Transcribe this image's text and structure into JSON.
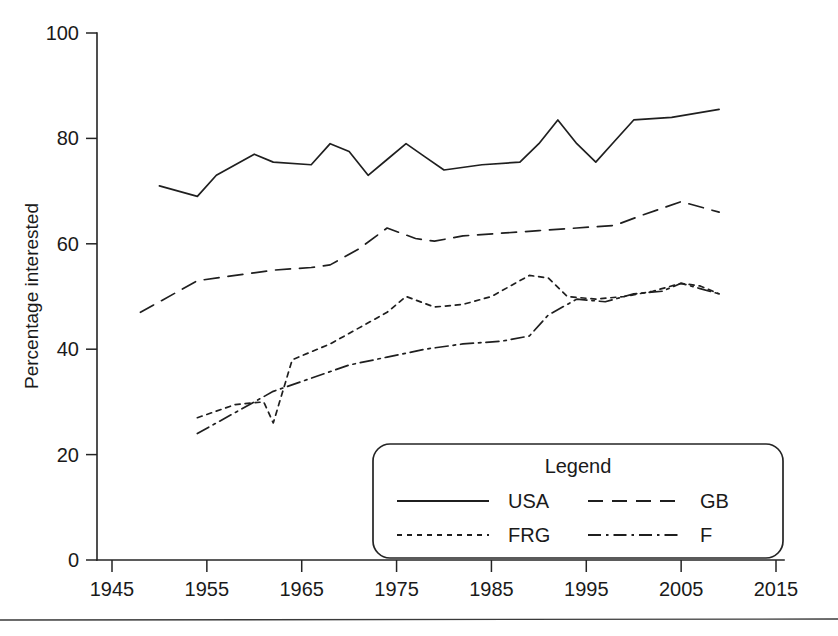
{
  "chart_data": {
    "type": "line",
    "title": "",
    "xlabel": "",
    "ylabel": "Percentage interested",
    "xlim": [
      1945,
      2015
    ],
    "ylim": [
      0,
      100
    ],
    "grid": false,
    "legend_position": "bottom-right",
    "legend_title": "Legend",
    "xticks": [
      "1945",
      "1955",
      "1965",
      "1975",
      "1985",
      "1995",
      "2005",
      "2015"
    ],
    "xtick_values": [
      1945,
      1955,
      1965,
      1975,
      1985,
      1995,
      2005,
      2015
    ],
    "yticks": [
      "0",
      "20",
      "40",
      "60",
      "80",
      "100"
    ],
    "ytick_values": [
      0,
      20,
      40,
      60,
      80,
      100
    ],
    "series": [
      {
        "name": "USA",
        "style": "solid",
        "x": [
          1950,
          1954,
          1956,
          1960,
          1962,
          1966,
          1968,
          1970,
          1972,
          1974,
          1976,
          1978,
          1980,
          1984,
          1988,
          1990,
          1992,
          1994,
          1996,
          1998,
          2000,
          2004,
          2009
        ],
        "values": [
          71,
          69,
          73,
          77,
          75.5,
          75,
          79,
          77.5,
          73,
          76,
          79,
          76.5,
          74,
          75,
          75.5,
          79,
          83.5,
          79,
          75.5,
          79.5,
          83.5,
          84,
          85.5
        ]
      },
      {
        "name": "GB",
        "style": "dashed",
        "x": [
          1948,
          1954,
          1958,
          1962,
          1966,
          1968,
          1971,
          1974,
          1977,
          1979,
          1982,
          1986,
          1990,
          1994,
          1998,
          2001,
          2005,
          2009
        ],
        "values": [
          47,
          53,
          54,
          55,
          55.5,
          56,
          59,
          63,
          61,
          60.5,
          61.5,
          62,
          62.5,
          63,
          63.5,
          65.5,
          68,
          66
        ]
      },
      {
        "name": "FRG",
        "style": "dotted",
        "x": [
          1954,
          1958,
          1961,
          1962,
          1964,
          1968,
          1971,
          1974,
          1976,
          1979,
          1982,
          1985,
          1987,
          1989,
          1991,
          1993,
          1996,
          1999,
          2002,
          2005,
          2007,
          2009
        ],
        "values": [
          27,
          29.5,
          30,
          26,
          38,
          41,
          44,
          47,
          50,
          48,
          48.5,
          50,
          52,
          54,
          53.5,
          50,
          49.5,
          50,
          51,
          52.5,
          52,
          50.5
        ]
      },
      {
        "name": "F",
        "style": "dashdot",
        "x": [
          1954,
          1958,
          1962,
          1966,
          1970,
          1974,
          1978,
          1982,
          1986,
          1989,
          1991,
          1994,
          1997,
          2000,
          2003,
          2005,
          2007,
          2009
        ],
        "values": [
          24,
          28,
          32,
          34.5,
          37,
          38.5,
          40,
          41,
          41.5,
          42.5,
          46.5,
          49.5,
          49,
          50.5,
          51,
          52.5,
          51.5,
          50.5
        ]
      }
    ]
  },
  "axes": {
    "y_title": "Percentage interested"
  },
  "legend": {
    "title": "Legend",
    "entries": [
      {
        "label": "USA",
        "style": "solid"
      },
      {
        "label": "GB",
        "style": "dashed"
      },
      {
        "label": "FRG",
        "style": "dotted"
      },
      {
        "label": "F",
        "style": "dashdot"
      }
    ]
  },
  "colors": {
    "ink": "#1f1f1f",
    "axis": "#242424",
    "background": "#ffffff"
  }
}
